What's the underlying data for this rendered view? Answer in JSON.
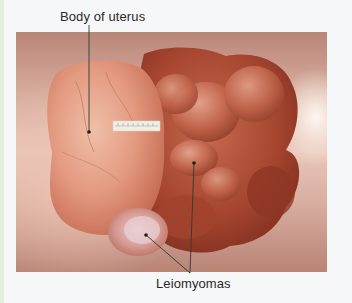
{
  "figure": {
    "labels": {
      "body_of_uterus": "Body of uterus",
      "leiomyomas": "Leiomyomas"
    },
    "leader_lines": [
      {
        "label": "Body of uterus",
        "from": [
          89,
          23
        ],
        "to": [
          89,
          132
        ]
      },
      {
        "label": "Leiomyomas",
        "from": [
          190,
          272
        ],
        "to": [
          194,
          163
        ]
      },
      {
        "label": "Leiomyomas",
        "from": [
          190,
          272
        ],
        "to": [
          146,
          235
        ]
      }
    ],
    "scale_bar": "ruler",
    "colors": {
      "page_background": "#f6f7f8",
      "photo_backdrop": "#d6ab9c",
      "uterus_body": "#e7a58f",
      "leiomyoma_dark": "#9b3f2c",
      "leiomyoma_light": "#c46a52",
      "label_text": "#2a2a2a",
      "leader_line": "#2f3a32"
    }
  }
}
